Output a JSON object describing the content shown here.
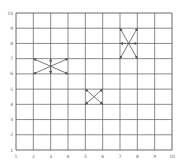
{
  "chart_data": {
    "type": "vector-diagram",
    "title": "",
    "xlabel": "",
    "ylabel": "",
    "xlim": [
      1,
      10
    ],
    "ylim": [
      1,
      10
    ],
    "grid": true,
    "x_ticks": [
      "1",
      "2",
      "3",
      "4",
      "5",
      "6",
      "7",
      "8",
      "9",
      "10"
    ],
    "y_ticks": [
      "1",
      "2",
      "3",
      "4",
      "5",
      "6",
      "7",
      "8",
      "9",
      "10"
    ],
    "groups": [
      {
        "name": "left-group",
        "center": [
          3,
          6.5
        ],
        "arrows": [
          [
            2,
            7
          ],
          [
            4,
            7
          ],
          [
            2,
            6
          ],
          [
            4,
            6
          ],
          [
            3,
            7
          ],
          [
            3,
            6
          ]
        ]
      },
      {
        "name": "middle-group",
        "center": [
          5.5,
          4.5
        ],
        "arrows": [
          [
            5,
            5
          ],
          [
            6,
            5
          ],
          [
            5,
            4
          ],
          [
            6,
            4
          ]
        ]
      },
      {
        "name": "right-group",
        "center": [
          7.5,
          8
        ],
        "arrows": [
          [
            7,
            9
          ],
          [
            8,
            9
          ],
          [
            7,
            7
          ],
          [
            8,
            7
          ],
          [
            7,
            8
          ],
          [
            8,
            8
          ]
        ]
      }
    ]
  },
  "colors": {
    "grid": "#5a5a5a",
    "arrow": "#555555",
    "background": "#ffffff"
  }
}
